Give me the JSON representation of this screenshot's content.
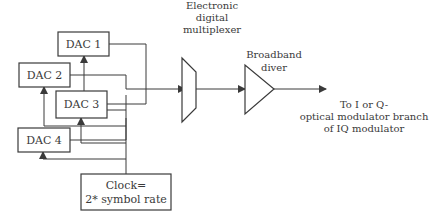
{
  "diagram": {
    "dacs": [
      {
        "label": "DAC 1"
      },
      {
        "label": "DAC 2"
      },
      {
        "label": "DAC 3"
      },
      {
        "label": "DAC 4"
      }
    ],
    "clock": {
      "line1": "Clock=",
      "line2": "2* symbol rate"
    },
    "mux": {
      "line1": "Electronic",
      "line2": "digital",
      "line3": "multiplexer"
    },
    "driver": {
      "line1": "Broadband",
      "line2": "diver"
    },
    "output": {
      "line1": "To I or Q-",
      "line2": "optical modulator branch",
      "line3": "of IQ modulator"
    },
    "colors": {
      "stroke": "#3a3a3a",
      "background": "#ffffff"
    }
  }
}
